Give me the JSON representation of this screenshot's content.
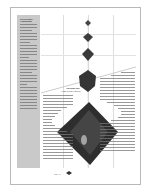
{
  "sidebar": {
    "title": "The Polyhedra Compendium",
    "paragraph_lines": 30
  },
  "article": {
    "heading": "The Right Stuff",
    "subheading": "Form Follows Function"
  },
  "figure": {
    "shapes": [
      "small-polyhedron",
      "medium-polyhedron",
      "large-polyhedron",
      "stellated-polyhedron",
      "star-tetrahedron"
    ],
    "shape_color": "#3a3a3a"
  },
  "footer": {
    "page_label": "Page 12"
  },
  "colors": {
    "sidebar_bg": "#c9c9c9",
    "page_border": "#b8b8b8",
    "grid": "#dddddd"
  }
}
